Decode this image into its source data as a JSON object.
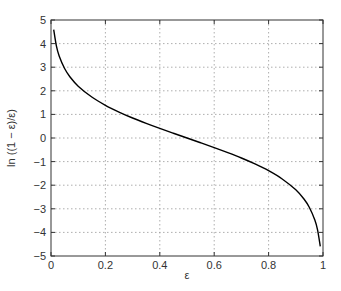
{
  "chart_data": {
    "type": "line",
    "title": "",
    "xlabel": "ε",
    "ylabel": "ln ((1 − ε)/ε)",
    "xlim": [
      0,
      1
    ],
    "ylim": [
      -5,
      5
    ],
    "grid": true,
    "xticks": [
      "0",
      "0.2",
      "0.4",
      "0.6",
      "0.8",
      "1"
    ],
    "yticks": [
      "5",
      "4",
      "3",
      "2",
      "1",
      "0",
      "−1",
      "−2",
      "−3",
      "−4",
      "−5"
    ],
    "series": [
      {
        "name": "ln((1-ε)/ε)",
        "color": "#000000",
        "x": [
          0.01,
          0.02,
          0.03,
          0.05,
          0.07,
          0.1,
          0.15,
          0.2,
          0.25,
          0.3,
          0.35,
          0.4,
          0.45,
          0.5,
          0.55,
          0.6,
          0.65,
          0.7,
          0.75,
          0.8,
          0.85,
          0.9,
          0.93,
          0.95,
          0.97,
          0.98,
          0.99
        ],
        "values": [
          4.595,
          3.892,
          3.476,
          2.944,
          2.587,
          2.197,
          1.735,
          1.386,
          1.099,
          0.847,
          0.619,
          0.405,
          0.201,
          0.0,
          -0.201,
          -0.405,
          -0.619,
          -0.847,
          -1.099,
          -1.386,
          -1.735,
          -2.197,
          -2.587,
          -2.944,
          -3.476,
          -3.892,
          -4.595
        ]
      }
    ]
  }
}
